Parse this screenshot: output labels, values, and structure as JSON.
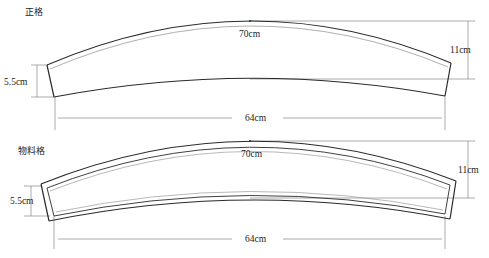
{
  "diagrams": [
    {
      "title": "正格",
      "top_length": "70cm",
      "bottom_length": "64cm",
      "height": "11cm",
      "end_width": "5.5cm"
    },
    {
      "title": "物料格",
      "top_length": "70cm",
      "bottom_length": "64cm",
      "height": "11cm",
      "end_width": "5.5cm"
    }
  ],
  "colors": {
    "outline": "#2a2a2a",
    "inner_line": "#9a9a9a",
    "dimension": "#777777"
  }
}
